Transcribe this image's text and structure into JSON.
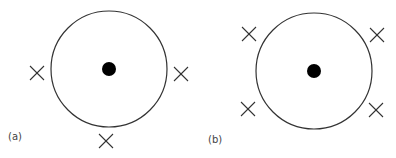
{
  "panels": [
    {
      "label": "(a)",
      "circle": {
        "cx": 109,
        "cy": 69,
        "r": 58
      },
      "dot": {
        "cx": 109,
        "cy": 69,
        "r": 7
      },
      "crosses": [
        {
          "x": 37,
          "y": 73
        },
        {
          "x": 181,
          "y": 74
        },
        {
          "x": 106,
          "y": 141
        }
      ]
    },
    {
      "label": "(b)",
      "circle": {
        "cx": 314,
        "cy": 71,
        "r": 58
      },
      "dot": {
        "cx": 314,
        "cy": 71,
        "r": 7
      },
      "crosses": [
        {
          "x": 249,
          "y": 34
        },
        {
          "x": 377,
          "y": 35
        },
        {
          "x": 248,
          "y": 109
        },
        {
          "x": 376,
          "y": 110
        }
      ]
    }
  ],
  "colors": {
    "stroke": "#333333",
    "dot": "#000000",
    "label": "#444444"
  }
}
